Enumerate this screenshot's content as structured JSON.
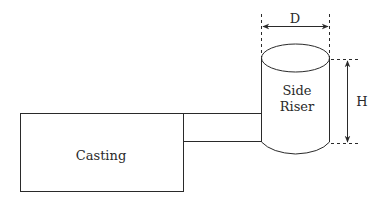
{
  "diagram": {
    "type": "side-riser-schematic",
    "labels": {
      "casting": "Casting",
      "riser_line1": "Side",
      "riser_line2": "Riser",
      "diameter": "D",
      "height": "H"
    },
    "colors": {
      "stroke": "#2a2a2a",
      "background": "#ffffff"
    }
  }
}
